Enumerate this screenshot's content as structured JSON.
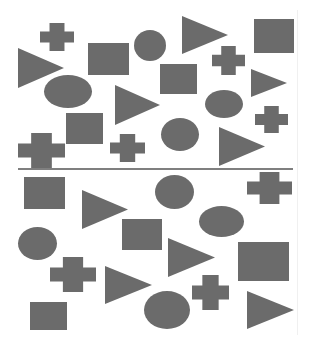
{
  "figure": {
    "width": 312,
    "height": 352,
    "background": "#ffffff",
    "shape_color": "#6b6b6b",
    "divider": {
      "x1": 18,
      "x2": 293,
      "y": 169,
      "color": "#555555"
    }
  },
  "panels": [
    {
      "name": "top",
      "shapes": [
        {
          "type": "cross",
          "x": 40,
          "y": 23,
          "w": 34,
          "h": 28
        },
        {
          "type": "triangle",
          "x": 18,
          "y": 48,
          "w": 46,
          "h": 40
        },
        {
          "type": "rect",
          "x": 88,
          "y": 43,
          "w": 41,
          "h": 32
        },
        {
          "type": "ellipse",
          "x": 134,
          "y": 30,
          "w": 32,
          "h": 31
        },
        {
          "type": "triangle",
          "x": 182,
          "y": 16,
          "w": 46,
          "h": 38
        },
        {
          "type": "rect",
          "x": 254,
          "y": 19,
          "w": 40,
          "h": 34
        },
        {
          "type": "cross",
          "x": 212,
          "y": 46,
          "w": 33,
          "h": 29
        },
        {
          "type": "rect",
          "x": 160,
          "y": 64,
          "w": 37,
          "h": 30
        },
        {
          "type": "triangle",
          "x": 251,
          "y": 69,
          "w": 36,
          "h": 28
        },
        {
          "type": "ellipse",
          "x": 44,
          "y": 75,
          "w": 48,
          "h": 33
        },
        {
          "type": "triangle",
          "x": 115,
          "y": 85,
          "w": 45,
          "h": 40
        },
        {
          "type": "ellipse",
          "x": 205,
          "y": 90,
          "w": 38,
          "h": 28
        },
        {
          "type": "cross",
          "x": 255,
          "y": 106,
          "w": 33,
          "h": 27
        },
        {
          "type": "ellipse",
          "x": 161,
          "y": 118,
          "w": 38,
          "h": 33
        },
        {
          "type": "triangle",
          "x": 219,
          "y": 127,
          "w": 46,
          "h": 39
        },
        {
          "type": "rect",
          "x": 66,
          "y": 113,
          "w": 37,
          "h": 31
        },
        {
          "type": "cross",
          "x": 18,
          "y": 133,
          "w": 47,
          "h": 35
        },
        {
          "type": "cross",
          "x": 110,
          "y": 134,
          "w": 35,
          "h": 28
        }
      ]
    },
    {
      "name": "bottom",
      "shapes": [
        {
          "type": "rect",
          "x": 24,
          "y": 177,
          "w": 41,
          "h": 32
        },
        {
          "type": "triangle",
          "x": 82,
          "y": 190,
          "w": 46,
          "h": 39
        },
        {
          "type": "ellipse",
          "x": 155,
          "y": 175,
          "w": 39,
          "h": 34
        },
        {
          "type": "cross",
          "x": 247,
          "y": 172,
          "w": 45,
          "h": 32
        },
        {
          "type": "ellipse",
          "x": 199,
          "y": 206,
          "w": 45,
          "h": 31
        },
        {
          "type": "rect",
          "x": 122,
          "y": 219,
          "w": 40,
          "h": 31
        },
        {
          "type": "ellipse",
          "x": 18,
          "y": 227,
          "w": 39,
          "h": 33
        },
        {
          "type": "triangle",
          "x": 168,
          "y": 238,
          "w": 47,
          "h": 39
        },
        {
          "type": "rect",
          "x": 238,
          "y": 242,
          "w": 51,
          "h": 39
        },
        {
          "type": "cross",
          "x": 50,
          "y": 257,
          "w": 46,
          "h": 35
        },
        {
          "type": "triangle",
          "x": 105,
          "y": 266,
          "w": 47,
          "h": 38
        },
        {
          "type": "ellipse",
          "x": 144,
          "y": 291,
          "w": 46,
          "h": 38
        },
        {
          "type": "cross",
          "x": 192,
          "y": 275,
          "w": 37,
          "h": 35
        },
        {
          "type": "triangle",
          "x": 247,
          "y": 291,
          "w": 47,
          "h": 38
        },
        {
          "type": "rect",
          "x": 30,
          "y": 302,
          "w": 37,
          "h": 28
        }
      ]
    }
  ]
}
